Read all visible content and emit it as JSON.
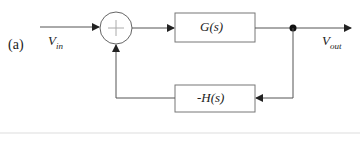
{
  "diagram": {
    "panel_label": "(a)",
    "input_label": "V",
    "input_sub": "in",
    "output_label": "V",
    "output_sub": "out",
    "forward_block": "G(s)",
    "feedback_block": "-H(s)",
    "summing_junction": "+",
    "colors": {
      "line": "#555555",
      "text": "#222222",
      "divider": "#dddddd"
    }
  }
}
